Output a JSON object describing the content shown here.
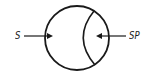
{
  "diagram": {
    "type": "circle-with-inner-arc",
    "stroke_color": "#1a1a1a",
    "labels": {
      "left": "S",
      "right": "SP"
    },
    "arrows": [
      {
        "from_label": "S",
        "direction": "right",
        "target": "circle-interior-left"
      },
      {
        "from_label": "SP",
        "direction": "left",
        "target": "circle-interior-right-region"
      }
    ]
  }
}
